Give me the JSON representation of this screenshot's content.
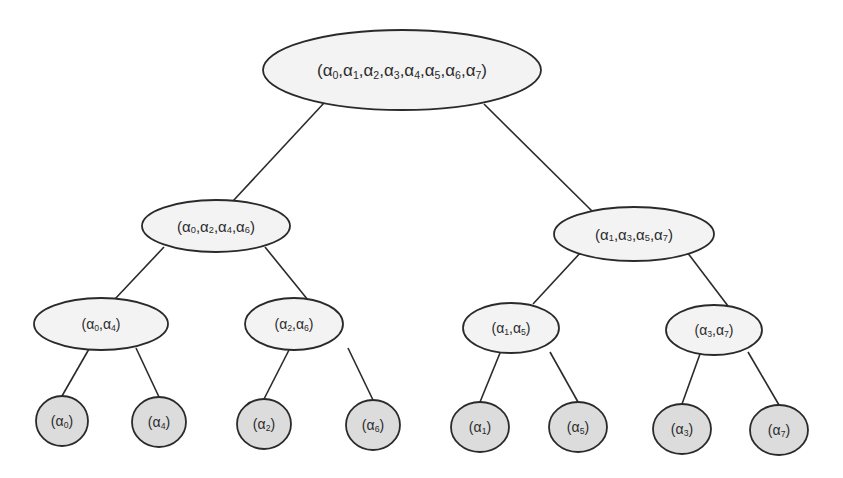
{
  "diagram": {
    "type": "binary-tree",
    "colors": {
      "internal_fill": "#f3f3f3",
      "leaf_fill": "#dcdcdc",
      "stroke": "#2a2a2a",
      "text": "#2b2b2b"
    },
    "nodes": [
      {
        "id": "root",
        "level": 0,
        "kind": "internal",
        "label": "(α0,α1,α2,α3,α4,α5,α6,α7)",
        "indices": [
          0,
          1,
          2,
          3,
          4,
          5,
          6,
          7
        ],
        "cx": 402,
        "cy": 70,
        "rx": 139,
        "ry": 40,
        "font": 17
      },
      {
        "id": "n-0246",
        "level": 1,
        "kind": "internal",
        "label": "(α0,α2,α4,α6)",
        "indices": [
          0,
          2,
          4,
          6
        ],
        "cx": 216,
        "cy": 226,
        "rx": 74,
        "ry": 26,
        "font": 15
      },
      {
        "id": "n-1357",
        "level": 1,
        "kind": "internal",
        "label": "(α1,α3,α5,α7)",
        "indices": [
          1,
          3,
          5,
          7
        ],
        "cx": 634,
        "cy": 234,
        "rx": 80,
        "ry": 27,
        "font": 15
      },
      {
        "id": "n-04",
        "level": 2,
        "kind": "internal",
        "label": "(α0,α4)",
        "indices": [
          0,
          4
        ],
        "cx": 101,
        "cy": 324,
        "rx": 67,
        "ry": 26,
        "font": 14
      },
      {
        "id": "n-26",
        "level": 2,
        "kind": "internal",
        "label": "(α2,α6)",
        "indices": [
          2,
          6
        ],
        "cx": 294,
        "cy": 324,
        "rx": 49,
        "ry": 26,
        "font": 14
      },
      {
        "id": "n-15",
        "level": 2,
        "kind": "internal",
        "label": "(α1,α5)",
        "indices": [
          1,
          5
        ],
        "cx": 511,
        "cy": 328,
        "rx": 48,
        "ry": 25,
        "font": 14
      },
      {
        "id": "n-37",
        "level": 2,
        "kind": "internal",
        "label": "(α3,α7)",
        "indices": [
          3,
          7
        ],
        "cx": 714,
        "cy": 330,
        "rx": 48,
        "ry": 25,
        "font": 14
      },
      {
        "id": "leaf-0",
        "level": 3,
        "kind": "leaf",
        "label": "(α0)",
        "indices": [
          0
        ],
        "cx": 62,
        "cy": 421,
        "rx": 26,
        "ry": 25,
        "font": 14
      },
      {
        "id": "leaf-4",
        "level": 3,
        "kind": "leaf",
        "label": "(α4)",
        "indices": [
          4
        ],
        "cx": 159,
        "cy": 422,
        "rx": 27,
        "ry": 25,
        "font": 14
      },
      {
        "id": "leaf-2",
        "level": 3,
        "kind": "leaf",
        "label": "(α2)",
        "indices": [
          2
        ],
        "cx": 264,
        "cy": 424,
        "rx": 27,
        "ry": 25,
        "font": 14
      },
      {
        "id": "leaf-6",
        "level": 3,
        "kind": "leaf",
        "label": "(α6)",
        "indices": [
          6
        ],
        "cx": 373,
        "cy": 425,
        "rx": 27,
        "ry": 25,
        "font": 14
      },
      {
        "id": "leaf-1",
        "level": 3,
        "kind": "leaf",
        "label": "(α1)",
        "indices": [
          1
        ],
        "cx": 480,
        "cy": 427,
        "rx": 29,
        "ry": 25,
        "font": 14
      },
      {
        "id": "leaf-5",
        "level": 3,
        "kind": "leaf",
        "label": "(α5)",
        "indices": [
          5
        ],
        "cx": 578,
        "cy": 427,
        "rx": 29,
        "ry": 25,
        "font": 14
      },
      {
        "id": "leaf-3",
        "level": 3,
        "kind": "leaf",
        "label": "(α3)",
        "indices": [
          3
        ],
        "cx": 682,
        "cy": 429,
        "rx": 29,
        "ry": 25,
        "font": 14
      },
      {
        "id": "leaf-7",
        "level": 3,
        "kind": "leaf",
        "label": "(α7)",
        "indices": [
          7
        ],
        "cx": 779,
        "cy": 430,
        "rx": 29,
        "ry": 25,
        "font": 14
      }
    ],
    "edges": [
      {
        "from": "root",
        "to": "n-0246",
        "x1": 324,
        "y1": 103,
        "x2": 233,
        "y2": 201
      },
      {
        "from": "root",
        "to": "n-1357",
        "x1": 484,
        "y1": 104,
        "x2": 592,
        "y2": 211
      },
      {
        "from": "n-0246",
        "to": "n-04",
        "x1": 164,
        "y1": 247,
        "x2": 115,
        "y2": 299
      },
      {
        "from": "n-0246",
        "to": "n-26",
        "x1": 265,
        "y1": 247,
        "x2": 308,
        "y2": 300
      },
      {
        "from": "n-1357",
        "to": "n-15",
        "x1": 582,
        "y1": 251,
        "x2": 533,
        "y2": 304
      },
      {
        "from": "n-1357",
        "to": "n-37",
        "x1": 687,
        "y1": 252,
        "x2": 728,
        "y2": 306
      },
      {
        "from": "n-04",
        "to": "leaf-0",
        "x1": 89,
        "y1": 349,
        "x2": 62,
        "y2": 396
      },
      {
        "from": "n-04",
        "to": "leaf-4",
        "x1": 136,
        "y1": 348,
        "x2": 159,
        "y2": 397
      },
      {
        "from": "n-26",
        "to": "leaf-2",
        "x1": 289,
        "y1": 350,
        "x2": 264,
        "y2": 399
      },
      {
        "from": "n-26",
        "to": "leaf-6",
        "x1": 348,
        "y1": 348,
        "x2": 373,
        "y2": 400
      },
      {
        "from": "n-15",
        "to": "leaf-1",
        "x1": 500,
        "y1": 353,
        "x2": 480,
        "y2": 402
      },
      {
        "from": "n-15",
        "to": "leaf-5",
        "x1": 550,
        "y1": 352,
        "x2": 578,
        "y2": 402
      },
      {
        "from": "n-37",
        "to": "leaf-3",
        "x1": 700,
        "y1": 354,
        "x2": 682,
        "y2": 404
      },
      {
        "from": "n-37",
        "to": "leaf-7",
        "x1": 748,
        "y1": 352,
        "x2": 779,
        "y2": 405
      }
    ]
  }
}
